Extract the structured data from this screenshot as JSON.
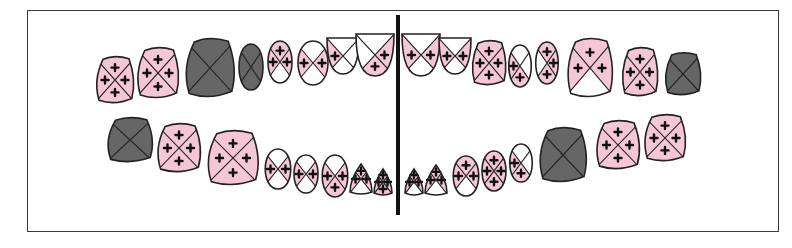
{
  "diagram": {
    "type": "dental-caries-chart",
    "colors": {
      "affected": "#f4c6d6",
      "healthy": "#ffffff",
      "missing_or_extracted": "#666666",
      "outline": "#222222",
      "midline": "#111111",
      "lesion_mark": "#111111"
    },
    "legend_meaning": {
      "pink_with_cross": "carious surface",
      "white": "sound surface",
      "dark_gray": "missing / extracted tooth"
    },
    "upper_arch": {
      "right": [
        {
          "pos": 1,
          "state": "affected",
          "surfaces": [
            "affected",
            "affected",
            "affected",
            "affected"
          ]
        },
        {
          "pos": 2,
          "state": "affected",
          "surfaces": [
            "affected",
            "affected",
            "affected",
            "affected"
          ]
        },
        {
          "pos": 3,
          "state": "missing"
        },
        {
          "pos": 4,
          "state": "missing"
        },
        {
          "pos": 5,
          "state": "partial",
          "surfaces": [
            "affected",
            "affected",
            "white",
            "affected"
          ]
        },
        {
          "pos": 6,
          "state": "partial",
          "surfaces": [
            "white",
            "affected",
            "white",
            "affected"
          ]
        },
        {
          "pos": 7,
          "state": "partial",
          "surfaces": [
            "white",
            "white",
            "white",
            "affected"
          ]
        },
        {
          "pos": 8,
          "state": "partial",
          "surfaces": [
            "white",
            "affected",
            "affected",
            "white"
          ]
        }
      ],
      "left": [
        {
          "pos": 8,
          "state": "partial",
          "surfaces": [
            "white",
            "affected",
            "white",
            "affected"
          ]
        },
        {
          "pos": 7,
          "state": "partial",
          "surfaces": [
            "white",
            "affected",
            "white",
            "affected"
          ]
        },
        {
          "pos": 6,
          "state": "affected",
          "surfaces": [
            "affected",
            "affected",
            "affected",
            "affected"
          ]
        },
        {
          "pos": 5,
          "state": "partial",
          "surfaces": [
            "white",
            "white",
            "affected",
            "affected"
          ]
        },
        {
          "pos": 4,
          "state": "affected",
          "surfaces": [
            "affected",
            "affected",
            "affected",
            "white"
          ]
        },
        {
          "pos": 3,
          "state": "partial",
          "surfaces": [
            "affected",
            "affected",
            "white",
            "affected"
          ]
        },
        {
          "pos": 2,
          "state": "affected",
          "surfaces": [
            "affected",
            "affected",
            "affected",
            "affected"
          ]
        },
        {
          "pos": 1,
          "state": "missing"
        }
      ]
    },
    "lower_arch": {
      "right": [
        {
          "pos": 1,
          "state": "missing"
        },
        {
          "pos": 2,
          "state": "affected",
          "surfaces": [
            "affected",
            "affected",
            "affected",
            "affected"
          ]
        },
        {
          "pos": 3,
          "state": "affected",
          "surfaces": [
            "affected",
            "affected",
            "affected",
            "affected"
          ]
        },
        {
          "pos": 4,
          "state": "partial",
          "surfaces": [
            "white",
            "affected",
            "white",
            "affected"
          ]
        },
        {
          "pos": 5,
          "state": "partial",
          "surfaces": [
            "white",
            "affected",
            "white",
            "affected"
          ]
        },
        {
          "pos": 6,
          "state": "partial",
          "surfaces": [
            "white",
            "affected",
            "affected",
            "affected"
          ]
        },
        {
          "pos": 7,
          "state": "partial",
          "surfaces": [
            "affected",
            "affected",
            "white",
            "affected"
          ]
        },
        {
          "pos": 8,
          "state": "affected",
          "surfaces": [
            "affected",
            "affected",
            "affected",
            "affected"
          ]
        }
      ],
      "left": [
        {
          "pos": 8,
          "state": "partial",
          "surfaces": [
            "affected",
            "affected",
            "white",
            "affected"
          ]
        },
        {
          "pos": 7,
          "state": "partial",
          "surfaces": [
            "affected",
            "affected",
            "white",
            "affected"
          ]
        },
        {
          "pos": 6,
          "state": "partial",
          "surfaces": [
            "affected",
            "affected",
            "white",
            "affected"
          ]
        },
        {
          "pos": 5,
          "state": "affected",
          "surfaces": [
            "affected",
            "affected",
            "affected",
            "affected"
          ]
        },
        {
          "pos": 4,
          "state": "partial",
          "surfaces": [
            "white",
            "white",
            "affected",
            "affected"
          ]
        },
        {
          "pos": 3,
          "state": "missing"
        },
        {
          "pos": 2,
          "state": "affected",
          "surfaces": [
            "affected",
            "affected",
            "affected",
            "affected"
          ]
        },
        {
          "pos": 1,
          "state": "affected",
          "surfaces": [
            "affected",
            "affected",
            "affected",
            "affected"
          ]
        }
      ]
    }
  }
}
